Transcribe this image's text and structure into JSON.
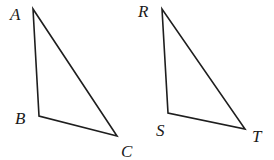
{
  "diagram": {
    "triangles": [
      {
        "name": "triangle-abc",
        "vertices": [
          {
            "label": "A",
            "x": 33,
            "y": 9,
            "label_x": 10,
            "label_y": 20
          },
          {
            "label": "B",
            "x": 39,
            "y": 116,
            "label_x": 15,
            "label_y": 124
          },
          {
            "label": "C",
            "x": 117,
            "y": 136,
            "label_x": 121,
            "label_y": 157
          }
        ]
      },
      {
        "name": "triangle-rst",
        "vertices": [
          {
            "label": "R",
            "x": 162,
            "y": 9,
            "label_x": 138,
            "label_y": 17
          },
          {
            "label": "S",
            "x": 168,
            "y": 113,
            "label_x": 156,
            "label_y": 136
          },
          {
            "label": "T",
            "x": 245,
            "y": 129,
            "label_x": 252,
            "label_y": 142
          }
        ]
      }
    ],
    "colors": {
      "stroke": "#1e1e1e",
      "background": "#ffffff"
    }
  }
}
